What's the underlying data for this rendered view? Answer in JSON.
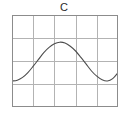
{
  "chart_data": {
    "type": "line",
    "title": "C",
    "xlabel": "",
    "ylabel": "",
    "xlim": [
      0,
      1
    ],
    "ylim": [
      -1.15,
      1.15
    ],
    "grid": true,
    "grid_x_divisions": 5,
    "grid_y_divisions": 4,
    "x_tick_labels": [],
    "y_tick_labels": [],
    "legend": "none",
    "series": [
      {
        "name": "curve-c",
        "color": "#4d4d4d",
        "x": [
          0.0,
          0.05,
          0.1,
          0.15,
          0.2,
          0.25,
          0.3,
          0.35,
          0.4,
          0.45,
          0.5,
          0.55,
          0.6,
          0.65,
          0.7,
          0.75,
          0.8,
          0.85,
          0.9,
          0.95,
          1.0
        ],
        "y": [
          -0.5,
          -0.48,
          -0.41,
          -0.29,
          -0.13,
          0.04,
          0.21,
          0.34,
          0.43,
          0.47,
          0.45,
          0.37,
          0.25,
          0.09,
          -0.08,
          -0.25,
          -0.38,
          -0.47,
          -0.5,
          -0.44,
          -0.29
        ]
      }
    ]
  },
  "figure": {
    "background_color": "#ffffff",
    "frame_color": "#8c8c8c",
    "grid_color": "#b3b3b3",
    "title_color": "#2b2b2b"
  }
}
